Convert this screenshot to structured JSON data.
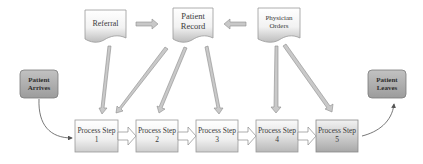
{
  "diagram": {
    "type": "process-flow",
    "documents": [
      {
        "id": "referral",
        "label": "Referral"
      },
      {
        "id": "patient-record",
        "label": "Patient Record",
        "lines": [
          "Patient",
          "Record"
        ]
      },
      {
        "id": "physician-orders",
        "label": "Physician Orders",
        "lines": [
          "Physician",
          "Orders"
        ]
      }
    ],
    "terminals": {
      "start": {
        "label": "Patient Arrives",
        "lines": [
          "Patient",
          "Arrives"
        ]
      },
      "end": {
        "label": "Patient Leaves",
        "lines": [
          "Patient",
          "Leaves"
        ]
      }
    },
    "steps": [
      {
        "title": "Process Step",
        "number": "1"
      },
      {
        "title": "Process Step",
        "number": "2"
      },
      {
        "title": "Process Step",
        "number": "3"
      },
      {
        "title": "Process Step",
        "number": "4"
      },
      {
        "title": "Process Step",
        "number": "5"
      }
    ],
    "edges": [
      {
        "from": "Referral",
        "to": "Patient Record"
      },
      {
        "from": "Physician Orders",
        "to": "Patient Record"
      },
      {
        "from": "Referral",
        "to": "Process Step 1"
      },
      {
        "from": "Patient Record",
        "to": "Process Step 2"
      },
      {
        "from": "Patient Record",
        "to": "Process Step 3"
      },
      {
        "from": "Patient Record",
        "to": "Process Step 4"
      },
      {
        "from": "Physician Orders",
        "to": "Process Step 4"
      },
      {
        "from": "Physician Orders",
        "to": "Process Step 5"
      },
      {
        "from": "Patient Arrives",
        "to": "Process Step 1"
      },
      {
        "from": "Process Step 1",
        "to": "Process Step 2"
      },
      {
        "from": "Process Step 2",
        "to": "Process Step 3"
      },
      {
        "from": "Process Step 3",
        "to": "Process Step 4"
      },
      {
        "from": "Process Step 4",
        "to": "Process Step 5"
      },
      {
        "from": "Process Step 5",
        "to": "Patient Leaves"
      }
    ],
    "colors": {
      "box_border": "#8c8c8c",
      "box_fill_top": "#ffffff",
      "box_fill_bottom": "#cfcfcf",
      "terminal_fill": "#a9a9a9",
      "terminal_border": "#7a7a7a",
      "arrow_fill": "#c4c4c4",
      "arrow_stroke": "#8a8a8a",
      "connector": "#555555"
    }
  }
}
